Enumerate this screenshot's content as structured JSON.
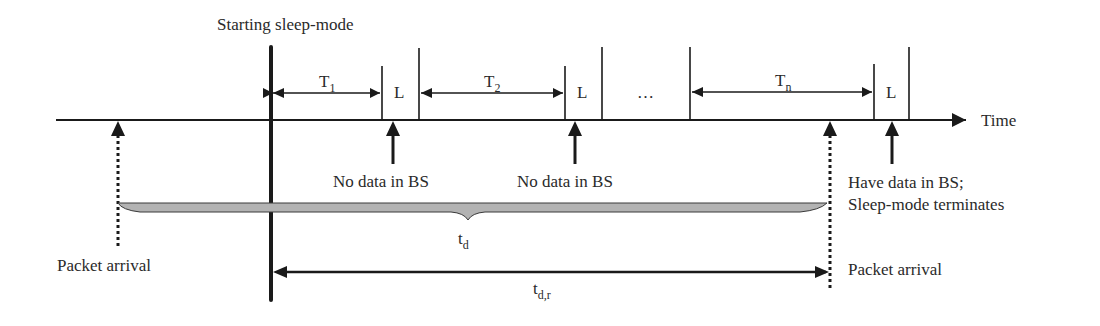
{
  "figure": {
    "title_label": "Starting sleep-mode",
    "axis_label": "Time",
    "periods": [
      {
        "symbol": "T",
        "subscript": "1"
      },
      {
        "symbol": "T",
        "subscript": "2"
      },
      {
        "symbol": "T",
        "subscript": "n"
      }
    ],
    "listen_label": "L",
    "ellipsis": "…",
    "events": {
      "no_data_1": "No data in BS",
      "no_data_2": "No data in BS",
      "have_data_line1": "Have data in BS;",
      "have_data_line2": "Sleep-mode terminates",
      "packet_arrival_left": "Packet arrival",
      "packet_arrival_right": "Packet arrival"
    },
    "intervals": {
      "delay": {
        "symbol": "t",
        "subscript": "d"
      },
      "response_delay": {
        "symbol": "t",
        "subscript": "d,r"
      }
    }
  },
  "colors": {
    "line": "#1a1a1a",
    "text": "#2a2a2a",
    "brace_fill": "#b3b3b3",
    "background": "#ffffff"
  }
}
